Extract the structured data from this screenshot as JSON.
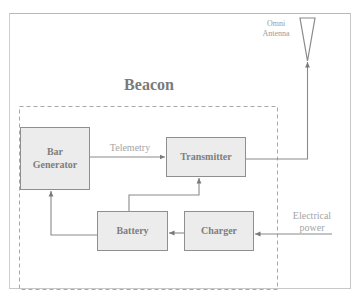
{
  "diagram": {
    "title": "Beacon",
    "antenna": {
      "label_line1": "Omni",
      "label_line2": "Antenna"
    },
    "blocks": {
      "bar_generator": {
        "line1": "Bar",
        "line2": "Generator"
      },
      "transmitter": {
        "label": "Transmitter"
      },
      "battery": {
        "label": "Battery"
      },
      "charger": {
        "label": "Charger"
      }
    },
    "edge_labels": {
      "telemetry": "Telemetry",
      "electrical_power_line1": "Electrical",
      "electrical_power_line2": "power"
    },
    "edges": [
      {
        "from": "Bar Generator",
        "to": "Transmitter",
        "label": "Telemetry"
      },
      {
        "from": "Transmitter",
        "to": "Omni Antenna",
        "label": ""
      },
      {
        "from": "Battery",
        "to": "Transmitter",
        "label": ""
      },
      {
        "from": "Battery",
        "to": "Bar Generator",
        "label": ""
      },
      {
        "from": "Charger",
        "to": "Battery",
        "label": ""
      },
      {
        "from": "Electrical power",
        "to": "Charger",
        "label": "Electrical power"
      }
    ],
    "colors": {
      "box_fill": "#ececec",
      "box_border": "#8f8f8f",
      "line": "#8a8a8a",
      "text": "#7e7e7e"
    }
  }
}
